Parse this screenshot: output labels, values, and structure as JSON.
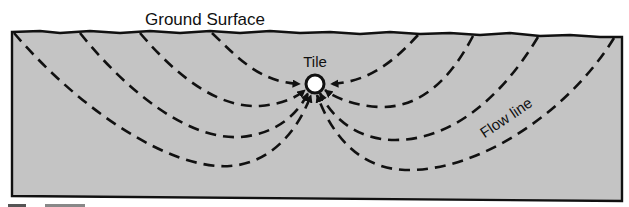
{
  "diagram": {
    "title": "Ground Surface",
    "tile_label": "Tile",
    "flow_label": "Flow line",
    "caption_fragment": "Figure ...",
    "colors": {
      "soil_fill": "#c4c4c4",
      "outline": "#111111",
      "tile_fill": "#ffffff",
      "background": "#ffffff"
    },
    "tile": {
      "cx": 315,
      "cy": 84,
      "r": 9
    },
    "flow_lines": [
      {
        "side": "left",
        "start_x": 212,
        "arrives": "horizontal"
      },
      {
        "side": "left",
        "start_x": 140,
        "lowest_y": 107
      },
      {
        "side": "left",
        "start_x": 80,
        "lowest_y": 137
      },
      {
        "side": "left",
        "start_x": 14,
        "lowest_y": 166
      },
      {
        "side": "right",
        "start_x": 418,
        "arrives": "horizontal"
      },
      {
        "side": "right",
        "start_x": 473,
        "lowest_y": 107
      },
      {
        "side": "right",
        "start_x": 538,
        "lowest_y": 140
      },
      {
        "side": "right",
        "start_x": 614,
        "lowest_y": 170
      }
    ]
  }
}
